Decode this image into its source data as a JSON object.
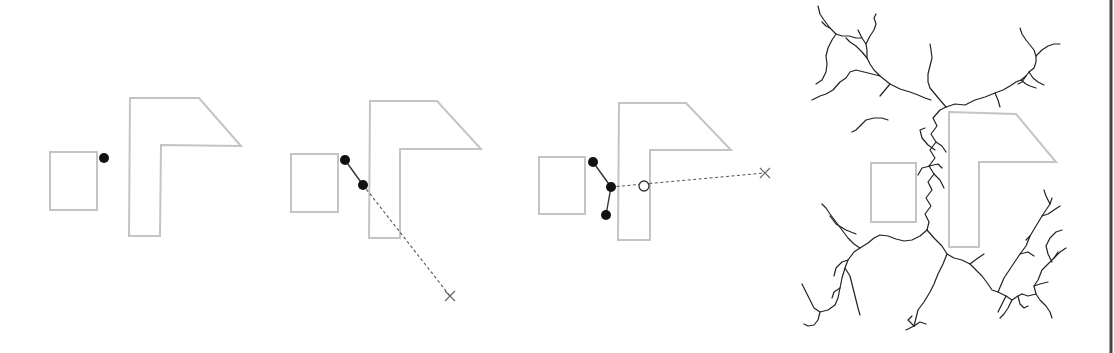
{
  "figure": {
    "colors": {
      "obstacle": "#c4c4c4",
      "node": "#111111",
      "edge": "#333333",
      "dashed": "#555555",
      "tree": "#222222",
      "frame": "#444444"
    },
    "panels": [
      {
        "id": "panel-1-initial",
        "obstacles": {
          "rect": [
            50,
            152,
            47,
            58
          ],
          "lshape": "130,98 199,98 241,146 161,145 160,236 129,236"
        },
        "nodes": [
          [
            104,
            158
          ]
        ],
        "edges": [],
        "dashed": [],
        "targets": [],
        "open_nodes": []
      },
      {
        "id": "panel-2-extend",
        "obstacles": {
          "rect": [
            291,
            154,
            47,
            58
          ],
          "lshape": "370,101 437,101 481,149 400,149 400,238 369,238"
        },
        "nodes": [
          [
            345,
            160
          ],
          [
            363,
            185
          ]
        ],
        "edges": [
          [
            [
              345,
              160
            ],
            [
              363,
              185
            ]
          ]
        ],
        "dashed": [
          [
            [
              363,
              185
            ],
            [
              450,
              296
            ]
          ]
        ],
        "targets": [
          [
            450,
            296
          ]
        ],
        "open_nodes": []
      },
      {
        "id": "panel-3-collision",
        "obstacles": {
          "rect": [
            539,
            157,
            46,
            57
          ],
          "lshape": "619,103 686,103 731,150 650,150 650,240 618,240"
        },
        "nodes": [
          [
            593,
            162
          ],
          [
            611,
            187
          ],
          [
            606,
            215
          ]
        ],
        "edges": [
          [
            [
              593,
              162
            ],
            [
              611,
              187
            ]
          ],
          [
            [
              611,
              187
            ],
            [
              606,
              215
            ]
          ]
        ],
        "dashed": [
          [
            [
              611,
              187
            ],
            [
              765,
              173
            ]
          ]
        ],
        "targets": [
          [
            765,
            173
          ]
        ],
        "open_nodes": [
          [
            644,
            186
          ]
        ]
      },
      {
        "id": "panel-4-full-tree",
        "obstacles": {
          "rect": [
            871,
            163,
            45,
            59
          ],
          "lshape": "949,112 1016,114 1056,162 979,162 979,247 949,247"
        }
      }
    ],
    "tree_paths": [
      "M927,230 L929,222 L925,214 L931,206 L926,198 L932,190 L928,182 L934,174 L929,166 L935,158 L930,150 L936,142 L931,134 L937,126 L933,118 L940,110 L946,107",
      "M946,107 L955,104 L965,105 L975,100 L985,97 L995,93 L1003,90 L1010,86 L1016,82 L1021,80 L1026,76 L1029,72 L1034,68 L1036,62 L1036,56 L1034,50 L1030,45 L1026,40 L1022,34 L1020,28",
      "M1036,56 L1042,50 L1048,46 L1054,44 L1060,44",
      "M1029,72 L1033,78 L1038,82 L1044,85",
      "M1026,76 L1022,82 L1018,84",
      "M1021,80 L1026,84 L1030,86 L1036,88",
      "M995,93 L998,100 L1000,107",
      "M946,107 L940,100 L935,94 L930,88 L928,82 L928,74 L930,66 L932,58 L931,50 L930,44",
      "M931,100 L925,98 L918,95 L910,92 L900,89 L890,84 L880,76 L874,70 L870,64 L867,58 L867,50 L866,44 L862,38 L858,30",
      "M890,84 L885,90 L880,96",
      "M880,76 L872,74 L864,72 L856,70 L850,72 L846,78 L840,82 L833,90 L826,94 L820,96 L812,100",
      "M867,58 L862,52 L856,46 L850,42 L846,38",
      "M866,44 L870,36 L874,30 L876,24 L874,18 L876,14",
      "M862,38 L856,38 L849,36 L842,36 L836,34 L830,28 L824,20 L820,14 L818,6",
      "M836,34 L832,40 L828,48 L826,56 L827,64 L826,72 L822,80 L816,84",
      "M830,28 L826,26 L822,22",
      "M888,120 L882,118 L874,118 L866,120 L860,126 L856,130 L852,132",
      "M935,150 L928,145 L922,138 L920,130 L925,128",
      "M936,142 L942,146 L946,152",
      "M930,166 L922,168 L918,175",
      "M934,174 L940,180 L944,188",
      "M929,166 L938,164 L942,168",
      "M927,230 L920,236 L912,240 L904,241 L896,239 L888,236 L880,235 L874,238 L868,243 L860,248 L854,252 L848,260 L845,268 L842,278 L840,288 L838,298 L835,305 L828,310 L820,312 L814,308 L810,300 L806,292 L802,284",
      "M860,248 L854,244 L848,238 L842,230 L836,222 L830,214 L826,208 L822,204",
      "M848,260 L842,262 L836,268 L834,276",
      "M845,268 L850,276 L852,284 L854,292 L856,300 L858,308 L860,315",
      "M840,288 L834,292 L832,298",
      "M820,312 L818,320 L814,325 L808,326 L804,324",
      "M830,216 L836,224 L846,230 L856,234",
      "M927,230 L934,238 L942,246 L947,254 L943,264 L938,274 L934,284 L930,292 L924,302 L918,310 L916,318 L914,326",
      "M914,326 L908,320 L912,316",
      "M914,326 L920,322 L926,324",
      "M914,326 L906,330",
      "M947,254 L954,258 L962,260 L970,264 L976,270 L982,276 L988,284 L992,290 L998,292 L1006,296 L1012,300 L1018,296 L1022,294",
      "M1022,294 L1028,296 L1036,294 L1040,300 L1046,306 L1050,312 L1052,318",
      "M1036,294 L1034,286 L1038,280 L1042,270 L1048,264 L1054,258 L1058,252",
      "M1052,262 L1048,254 L1046,246 L1050,238 L1056,232 L1062,230",
      "M1034,286 L1040,284 L1048,282",
      "M998,292 L1004,278 L1012,266 L1020,254 L1026,246 L1030,236 L1036,226 L1042,216 L1046,210 L1050,204 L1052,198",
      "M1020,254 L1028,252 L1034,256",
      "M1030,236 L1026,240",
      "M1042,216 L1048,214 L1054,210 L1060,206",
      "M1050,204 L1046,196 L1044,190",
      "M1012,300 L1008,308 L1004,314 L1000,318",
      "M1006,296 L1002,304 L998,312",
      "M1018,296 L1020,304 L1024,308 L1028,306",
      "M1054,258 L1060,252 L1066,248",
      "M970,264 L978,258 L984,254"
    ]
  }
}
